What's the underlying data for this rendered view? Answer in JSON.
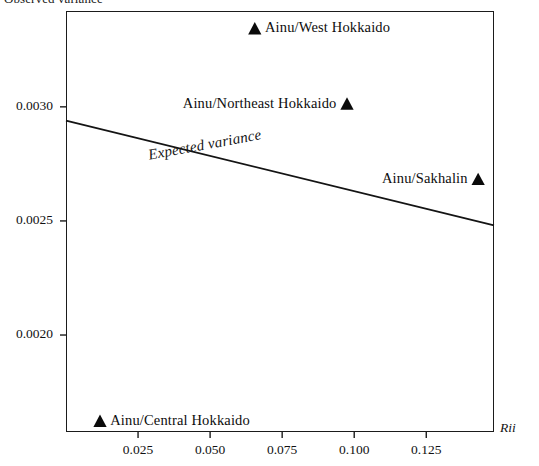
{
  "chart_data": {
    "type": "scatter",
    "title": "",
    "ylabel": "Observed variance",
    "xlabel": "Rii",
    "xlim": [
      0.0,
      0.1485
    ],
    "ylim": [
      0.001575,
      0.00342
    ],
    "grid": false,
    "legend": "none",
    "xticks": [
      "0.025",
      "0.050",
      "0.075",
      "0.100",
      "0.125"
    ],
    "xtick_values": [
      0.025,
      0.05,
      0.075,
      0.1,
      0.125
    ],
    "yticks": [
      "0.0030",
      "0.0025",
      "0.0020"
    ],
    "ytick_values": [
      0.003,
      0.0025,
      0.002
    ],
    "points": [
      {
        "label": "Ainu/West Hokkaido",
        "x": 0.0655,
        "y": 0.00334,
        "label_side": "right",
        "marker": "triangle-up"
      },
      {
        "label": "Ainu/Northeast Hokkaido",
        "x": 0.0975,
        "y": 0.00301,
        "label_side": "left",
        "marker": "triangle-up"
      },
      {
        "label": "Ainu/Sakhalin",
        "x": 0.143,
        "y": 0.00268,
        "label_side": "left",
        "marker": "triangle-up"
      },
      {
        "label": "Ainu/Central Hokkaido",
        "x": 0.0118,
        "y": 0.00162,
        "label_side": "right",
        "marker": "triangle-up"
      }
    ],
    "series": [
      {
        "name": "Expected variance",
        "type": "line",
        "x": [
          0.0,
          0.1485
        ],
        "values": [
          0.00294,
          0.00248
        ]
      }
    ],
    "annotations": [
      {
        "text": "Expected variance",
        "x": 0.028,
        "y": 0.002825,
        "rotation": -10.4,
        "style": "italic"
      }
    ]
  },
  "axes": {
    "y_caption": "Observed variance",
    "x_caption": "Rii"
  },
  "ytick_labels": [
    "0.0030",
    "0.0025",
    "0.0020"
  ],
  "xtick_labels": [
    "0.025",
    "0.050",
    "0.075",
    "0.100",
    "0.125"
  ],
  "point_labels": [
    "Ainu/West Hokkaido",
    "Ainu/Northeast Hokkaido",
    "Ainu/Sakhalin",
    "Ainu/Central Hokkaido"
  ],
  "line_label": "Expected variance"
}
